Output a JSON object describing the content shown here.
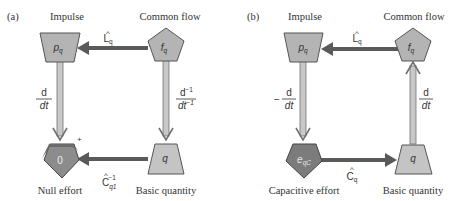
{
  "panels": [
    {
      "label": "(a)",
      "nodes": {
        "top_left": {
          "title": "Impulse",
          "symbol": "p",
          "subscript": "q",
          "shape": "trapezoid-inverted",
          "fill": "#b4b4b4"
        },
        "top_right": {
          "title": "Common flow",
          "symbol": "f",
          "subscript": "q",
          "shape": "pentagon",
          "fill": "#b4b4b4"
        },
        "bottom_left": {
          "title": "Null effort",
          "symbol": "0",
          "subscript": "",
          "shape": "pentagon",
          "fill": "#7c7c7c",
          "sign": "+"
        },
        "bottom_right": {
          "title": "Basic quantity",
          "symbol": "q",
          "subscript": "",
          "shape": "trapezoid",
          "fill": "#c4c4c4"
        }
      },
      "edges": {
        "top": {
          "direction": "right-to-left",
          "operator": "L",
          "hat": "^",
          "subscript": "q",
          "superscript": ""
        },
        "left": {
          "direction": "down",
          "numerator": "d",
          "denominator": "dt",
          "prefix": ""
        },
        "right": {
          "direction": "down",
          "numerator": "d",
          "num_sup": "−1",
          "denominator": "dt",
          "den_sup": "−1"
        },
        "bottom": {
          "direction": "right-to-left",
          "operator": "C",
          "hat": "^",
          "subscript": "q1",
          "superscript": "−1"
        }
      }
    },
    {
      "label": "(b)",
      "nodes": {
        "top_left": {
          "title": "Impulse",
          "symbol": "p",
          "subscript": "q",
          "shape": "trapezoid-inverted",
          "fill": "#b4b4b4"
        },
        "top_right": {
          "title": "Common flow",
          "symbol": "f",
          "subscript": "q",
          "shape": "pentagon",
          "fill": "#b4b4b4"
        },
        "bottom_left": {
          "title": "Capacitive effort",
          "symbol": "e",
          "subscript": "qC",
          "shape": "pentagon",
          "fill": "#7c7c7c"
        },
        "bottom_right": {
          "title": "Basic quantity",
          "symbol": "q",
          "subscript": "",
          "shape": "trapezoid",
          "fill": "#c4c4c4"
        }
      },
      "edges": {
        "top": {
          "direction": "right-to-left",
          "operator": "L",
          "hat": "^",
          "subscript": "q"
        },
        "left": {
          "direction": "down",
          "numerator": "d",
          "denominator": "dt",
          "prefix": "−"
        },
        "right": {
          "direction": "up",
          "numerator": "d",
          "denominator": "dt",
          "prefix": ""
        },
        "bottom": {
          "direction": "left-to-right",
          "operator": "C",
          "hat": "^",
          "subscript": "q"
        }
      }
    }
  ],
  "colors": {
    "arrow_dark": "#5a5a5a",
    "arrow_light_fill": "#c8c8c8",
    "arrow_light_stroke": "#707070",
    "shape_stroke": "#555555"
  }
}
